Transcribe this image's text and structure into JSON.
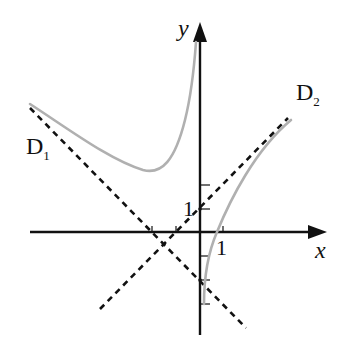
{
  "diagram": {
    "type": "function-graph-with-asymptotes",
    "axes": {
      "x_label": "x",
      "y_label": "y",
      "x_tick_label": "1",
      "y_tick_label": "1",
      "origin_px": [
        199,
        232
      ],
      "unit_px": 23.5,
      "x_ticks": [
        -2,
        -1,
        1
      ],
      "y_ticks": [
        -3,
        -2,
        -1,
        1,
        2
      ]
    },
    "asymptotes": [
      {
        "name": "D",
        "sub": "1",
        "equation": "y = -x - 2",
        "style": "dashed"
      },
      {
        "name": "D",
        "sub": "2",
        "equation": "y = x + 1",
        "style": "dashed"
      }
    ],
    "vertical_asymptote": "x = 0",
    "curve_color": "#b0b0b0",
    "line_color": "#111111"
  }
}
